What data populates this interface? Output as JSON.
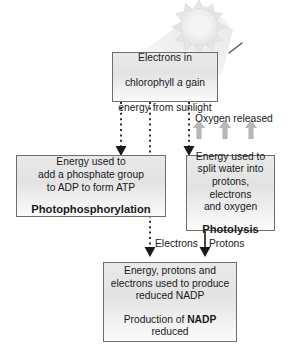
{
  "diagram": {
    "decor": {
      "sun_icon": "sun-icon",
      "light_cone": "light-cone",
      "ray_tick": "light-ray-tick"
    },
    "colors": {
      "box_border": "#6e6e72",
      "box_fill_top": "#e9e9ea",
      "box_fill_bottom": "#fbfbfb",
      "text": "#1a1a1a",
      "connector": "#1a1a1a",
      "oxygen_arrow": "#b5b5b7",
      "sun": "#ededee"
    },
    "nodes": {
      "electrons": {
        "line1": "Electrons in",
        "line2_pre": "chlorophyll ",
        "line2_italic": "a",
        "line2_post": " gain",
        "line3": "energy from sunlight"
      },
      "photophosphorylation": {
        "body": "Energy used to\nadd a phosphate group\nto ADP to form ATP",
        "term": "Photophosphorylation"
      },
      "photolysis": {
        "body": "Energy used to\nsplit water into\nprotons, electrons\nand oxygen",
        "term": "Photolysis"
      },
      "nadp": {
        "body": "Energy, protons and\nelectrons used to produce\nreduced NADP",
        "term_pre": "Production of ",
        "term_bold": "NADP",
        "term_post": "\nreduced"
      }
    },
    "labels": {
      "oxygen_released": "Oxygen released",
      "electrons": "Electrons",
      "protons": "Protons"
    }
  }
}
